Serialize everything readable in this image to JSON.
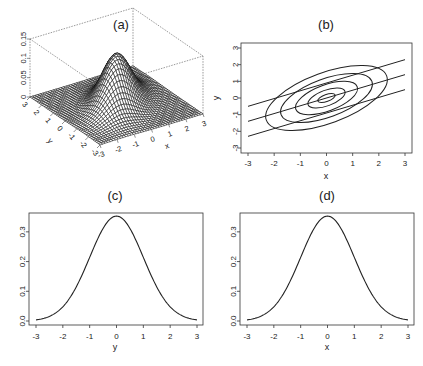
{
  "chart_data": [
    {
      "panel": "(a)",
      "type": "surface",
      "title": "(a)",
      "description": "3D perspective plot of a correlated bivariate normal density",
      "xlabel": "x",
      "ylabel": "y",
      "zlabel": "",
      "x_ticks": [
        "-3",
        "-2",
        "-1",
        "0",
        "1",
        "2",
        "3"
      ],
      "y_ticks": [
        "-3",
        "-2",
        "-1",
        "0",
        "1",
        "2",
        "3"
      ],
      "z_ticks": [
        "0",
        "0.05",
        "0.1",
        "0.15"
      ],
      "xlim": [
        -3,
        3
      ],
      "ylim": [
        -3,
        3
      ],
      "zlim": [
        0,
        0.15
      ],
      "peak": {
        "x": 0,
        "y": 0,
        "z": 0.13
      }
    },
    {
      "panel": "(b)",
      "type": "contour",
      "title": "(b)",
      "xlabel": "x",
      "ylabel": "y",
      "x_ticks": [
        "-3",
        "-2",
        "-1",
        "0",
        "1",
        "2",
        "3"
      ],
      "y_ticks": [
        "-3",
        "-2",
        "-1",
        "0",
        "1",
        "2",
        "3"
      ],
      "xlim": [
        -3,
        3
      ],
      "ylim": [
        -3,
        3
      ],
      "contours": [
        {
          "level": 1,
          "semi_x": 0.35,
          "semi_y": 0.2
        },
        {
          "level": 2,
          "semi_x": 0.75,
          "semi_y": 0.45
        },
        {
          "level": 3,
          "semi_x": 1.25,
          "semi_y": 0.75
        },
        {
          "level": 4,
          "semi_x": 1.85,
          "semi_y": 1.1
        },
        {
          "level": 5,
          "semi_x": 2.45,
          "semi_y": 1.45
        }
      ],
      "contour_tilt_deg": 28,
      "lines": [
        {
          "name": "upper",
          "x": [
            -3,
            3
          ],
          "y": [
            -0.5,
            2.3
          ]
        },
        {
          "name": "middle",
          "x": [
            -3,
            3
          ],
          "y": [
            -1.4,
            1.4
          ]
        },
        {
          "name": "lower",
          "x": [
            -3,
            3
          ],
          "y": [
            -2.3,
            0.5
          ]
        }
      ]
    },
    {
      "panel": "(c)",
      "type": "line",
      "title": "(c)",
      "xlabel": "y",
      "ylabel": "",
      "x_ticks": [
        "-3",
        "-2",
        "-1",
        "0",
        "1",
        "2",
        "3"
      ],
      "y_ticks": [
        "0.0",
        "0.1",
        "0.2",
        "0.3"
      ],
      "xlim": [
        -3,
        3
      ],
      "ylim": [
        0,
        0.35
      ],
      "x": [
        -3,
        -2.5,
        -2,
        -1.5,
        -1,
        -0.5,
        0,
        0.5,
        1,
        1.5,
        2,
        2.5,
        3
      ],
      "values": [
        0.011,
        0.033,
        0.076,
        0.144,
        0.224,
        0.31,
        0.353,
        0.31,
        0.224,
        0.144,
        0.076,
        0.033,
        0.011
      ]
    },
    {
      "panel": "(d)",
      "type": "line",
      "title": "(d)",
      "xlabel": "x",
      "ylabel": "",
      "x_ticks": [
        "-3",
        "-2",
        "-1",
        "0",
        "1",
        "2",
        "3"
      ],
      "y_ticks": [
        "0.0",
        "0.1",
        "0.2",
        "0.3"
      ],
      "xlim": [
        -3,
        3
      ],
      "ylim": [
        0,
        0.35
      ],
      "x": [
        -3,
        -2.5,
        -2,
        -1.5,
        -1,
        -0.5,
        0,
        0.5,
        1,
        1.5,
        2,
        2.5,
        3
      ],
      "values": [
        0.011,
        0.033,
        0.076,
        0.144,
        0.224,
        0.31,
        0.353,
        0.31,
        0.224,
        0.144,
        0.076,
        0.033,
        0.011
      ]
    }
  ],
  "labels": {
    "a": "(a)",
    "b": "(b)",
    "c": "(c)",
    "d": "(d)",
    "b_xlabel": "x",
    "b_ylabel": "y",
    "c_xlabel": "y",
    "d_xlabel": "x",
    "a_xlabel": "x",
    "a_ylabel": "y"
  }
}
